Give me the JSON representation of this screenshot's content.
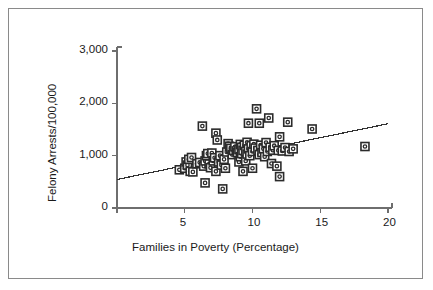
{
  "chart_data": {
    "type": "scatter",
    "title": "",
    "xlabel": "Families in Poverty (Percentage)",
    "ylabel": "Felony Arrests/100,000",
    "xlim": [
      0,
      20
    ],
    "ylim": [
      0,
      3000
    ],
    "xticks": [
      5,
      10,
      15,
      20
    ],
    "xtick_labels": [
      "5",
      "10",
      "15",
      "20"
    ],
    "yticks": [
      0,
      1000,
      2000,
      3000
    ],
    "ytick_labels": [
      "0",
      "1,000",
      "2,000",
      "3,000"
    ],
    "grid": false,
    "legend": null,
    "marker": "square-with-center-dot",
    "marker_color": "#2b2b2b",
    "marker_fill": "#ffffff",
    "axis_color": "#6e6e6e",
    "border_color": "#8a8a8a",
    "trendline": {
      "label": "linear fit",
      "color": "#333333",
      "x": [
        0,
        20
      ],
      "y": [
        545,
        1610
      ]
    },
    "points": [
      [
        4.6,
        730
      ],
      [
        5.0,
        760
      ],
      [
        5.1,
        880
      ],
      [
        5.2,
        820
      ],
      [
        5.3,
        930
      ],
      [
        5.4,
        700
      ],
      [
        5.5,
        965
      ],
      [
        5.6,
        690
      ],
      [
        5.9,
        845
      ],
      [
        6.1,
        870
      ],
      [
        6.3,
        1565
      ],
      [
        6.4,
        800
      ],
      [
        6.5,
        900
      ],
      [
        6.5,
        480
      ],
      [
        6.6,
        1000
      ],
      [
        6.7,
        1040
      ],
      [
        6.8,
        840
      ],
      [
        6.9,
        770
      ],
      [
        7.0,
        1050
      ],
      [
        7.1,
        900
      ],
      [
        7.2,
        960
      ],
      [
        7.3,
        1430
      ],
      [
        7.3,
        700
      ],
      [
        7.4,
        1300
      ],
      [
        7.5,
        880
      ],
      [
        7.6,
        1000
      ],
      [
        7.7,
        820
      ],
      [
        7.8,
        365
      ],
      [
        7.9,
        930
      ],
      [
        8.0,
        760
      ],
      [
        8.1,
        1070
      ],
      [
        8.2,
        1230
      ],
      [
        8.3,
        1180
      ],
      [
        8.4,
        1140
      ],
      [
        8.5,
        1020
      ],
      [
        8.6,
        1100
      ],
      [
        8.7,
        1170
      ],
      [
        8.8,
        1090
      ],
      [
        8.9,
        1055
      ],
      [
        9.0,
        1120
      ],
      [
        9.0,
        880
      ],
      [
        9.1,
        1215
      ],
      [
        9.1,
        980
      ],
      [
        9.2,
        1160
      ],
      [
        9.2,
        1040
      ],
      [
        9.3,
        1100
      ],
      [
        9.3,
        700
      ],
      [
        9.4,
        1200
      ],
      [
        9.5,
        1080
      ],
      [
        9.5,
        900
      ],
      [
        9.6,
        1255
      ],
      [
        9.6,
        1030
      ],
      [
        9.7,
        1620
      ],
      [
        9.7,
        1130
      ],
      [
        9.8,
        1000
      ],
      [
        9.9,
        1190
      ],
      [
        10.0,
        1080
      ],
      [
        10.0,
        760
      ],
      [
        10.1,
        1220
      ],
      [
        10.2,
        1145
      ],
      [
        10.3,
        1895
      ],
      [
        10.4,
        1100
      ],
      [
        10.5,
        1020
      ],
      [
        10.5,
        1620
      ],
      [
        10.6,
        1200
      ],
      [
        10.7,
        1060
      ],
      [
        10.8,
        1130
      ],
      [
        10.9,
        980
      ],
      [
        11.0,
        1250
      ],
      [
        11.1,
        1080
      ],
      [
        11.2,
        1720
      ],
      [
        11.3,
        1160
      ],
      [
        11.4,
        850
      ],
      [
        11.5,
        1105
      ],
      [
        11.6,
        1190
      ],
      [
        11.8,
        800
      ],
      [
        11.9,
        1100
      ],
      [
        12.0,
        1360
      ],
      [
        12.0,
        600
      ],
      [
        12.2,
        1090
      ],
      [
        12.4,
        1155
      ],
      [
        12.6,
        1640
      ],
      [
        12.7,
        1080
      ],
      [
        13.0,
        1130
      ],
      [
        14.4,
        1510
      ],
      [
        18.3,
        1175
      ]
    ]
  }
}
